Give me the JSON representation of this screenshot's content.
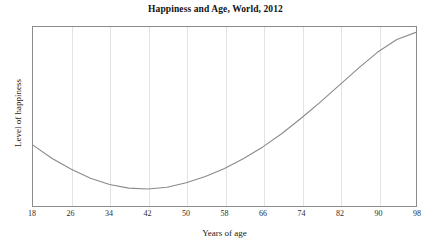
{
  "chart_data": {
    "type": "line",
    "title": "Happiness and Age, World, 2012",
    "xlabel": "Years of age",
    "ylabel": "Level of happiness",
    "xlim": [
      18,
      98
    ],
    "ylim": [
      0,
      100
    ],
    "xticks": [
      18,
      26,
      34,
      42,
      50,
      58,
      66,
      74,
      82,
      90,
      98
    ],
    "xtick_labels": [
      "18",
      "26",
      "34",
      "42",
      "50",
      "58",
      "66",
      "74",
      "82",
      "90",
      "98"
    ],
    "yticks": [],
    "ytick_labels": [],
    "grid": "vertical-only",
    "legend": "none",
    "line_color": "#8a8a8a",
    "axis_color": "#8c8c8c",
    "grid_color": "#e3e3e3",
    "background_color": "#ffffff",
    "series": [
      {
        "name": "Level of happiness",
        "x": [
          18,
          22,
          26,
          30,
          34,
          38,
          42,
          46,
          50,
          54,
          58,
          62,
          66,
          70,
          74,
          78,
          82,
          86,
          90,
          94,
          98
        ],
        "values": [
          34,
          26.5,
          20.5,
          15.5,
          12,
          10,
          9.5,
          10.5,
          13,
          16.5,
          21,
          26.5,
          33,
          40.5,
          49,
          58,
          67.5,
          77,
          86,
          93,
          97
        ]
      }
    ],
    "annotations": [
      "U-shaped curve: happiness declines from age 18 to a minimum near age 42, then rises steadily through age 98."
    ]
  }
}
